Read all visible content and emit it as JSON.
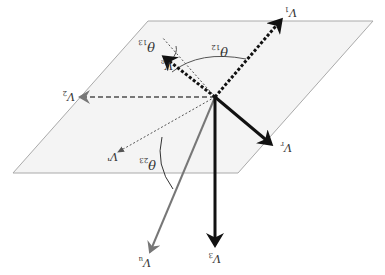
{
  "diagram": {
    "colors": {
      "plane_fill": "#f4f4f4",
      "plane_edge": "#aaaaaa",
      "black": "#111111",
      "gray": "#777777"
    },
    "labels": {
      "v1": "V",
      "v1_sub": "1",
      "ve": "V",
      "ve_sub": "e",
      "v2": "V",
      "v2_sub": "2",
      "vprime": "V'",
      "v": "V",
      "v_sub": "r",
      "v3": "V",
      "v3_sub": "3",
      "vu": "V",
      "vu_sub": "u",
      "theta12": "θ",
      "theta12_sub": "12",
      "theta13": "θ",
      "theta13_sub": "13",
      "theta23": "θ",
      "theta23_sub": "23"
    }
  }
}
